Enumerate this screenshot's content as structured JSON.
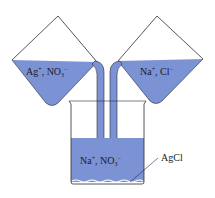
{
  "colors": {
    "solution": "#7b93d4",
    "outline": "#2a2a3a",
    "background": "#ffffff"
  },
  "left_flask": {
    "label_ion1": "Ag",
    "label_ion1_charge": "+",
    "label_sep": ", ",
    "label_ion2": "NO",
    "label_ion2_sub": "3",
    "label_ion2_charge": "−"
  },
  "right_flask": {
    "label_ion1": "Na",
    "label_ion1_charge": "+",
    "label_sep": ", ",
    "label_ion2": "Cl",
    "label_ion2_charge": "−"
  },
  "beaker": {
    "label_ion1": "Na",
    "label_ion1_charge": "+",
    "label_sep": ", ",
    "label_ion2": "NO",
    "label_ion2_sub": "3",
    "label_ion2_charge": "−"
  },
  "precipitate": {
    "label": "AgCl"
  }
}
